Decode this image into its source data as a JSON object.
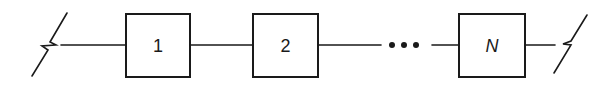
{
  "diagram": {
    "type": "series-chain",
    "colors": {
      "stroke": "#1a1a1a",
      "background": "#ffffff"
    },
    "left_terminal": {
      "symbol": "break-line-icon"
    },
    "blocks": [
      {
        "label": "1",
        "italic": false
      },
      {
        "label": "2",
        "italic": false
      },
      {
        "label": "N",
        "italic": true
      }
    ],
    "ellipsis": {
      "symbol": "ellipsis-dots",
      "count": 3
    },
    "right_terminal": {
      "symbol": "break-line-icon"
    }
  }
}
